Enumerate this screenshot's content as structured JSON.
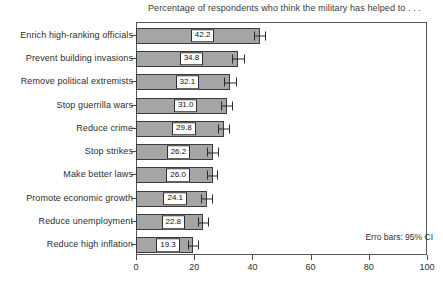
{
  "chart_data": {
    "type": "bar",
    "orientation": "horizontal",
    "title": "Percentage of respondents who think the military has helped to . . .",
    "xlabel": "",
    "ylabel": "",
    "xlim": [
      0,
      100
    ],
    "xticks": [
      0,
      20,
      40,
      60,
      80,
      100
    ],
    "grid": false,
    "legend": null,
    "annotation": "Erro bars: 95% CI",
    "error_bar_type": "95% CI",
    "categories": [
      "Enrich high-ranking officials",
      "Prevent building invasions",
      "Remove political extremists",
      "Stop guerrilla wars",
      "Reduce crime",
      "Stop strikes",
      "Make better laws",
      "Promote economic growth",
      "Reduce unemployment",
      "Reduce high inflation"
    ],
    "values": [
      42.2,
      34.8,
      32.1,
      31.0,
      29.8,
      26.2,
      26.0,
      24.1,
      22.8,
      19.3
    ],
    "value_labels": [
      "42.2",
      "34.8",
      "32.1",
      "31.0",
      "29.8",
      "26.2",
      "26.0",
      "24.1",
      "22.8",
      "19.3"
    ],
    "error_low": [
      40.2,
      32.6,
      30.0,
      28.9,
      27.8,
      24.2,
      24.0,
      22.1,
      20.8,
      17.4
    ],
    "error_high": [
      44.2,
      37.0,
      34.2,
      33.1,
      31.8,
      28.2,
      28.0,
      26.1,
      24.8,
      21.2
    ],
    "colors": {
      "bar_fill": "#a5a5a5",
      "bar_edge": "#3b3b3b",
      "frame": "#555555",
      "error_bar": "#2a2a2a",
      "background": "#ffffff",
      "text": "#2e2e2e"
    }
  }
}
